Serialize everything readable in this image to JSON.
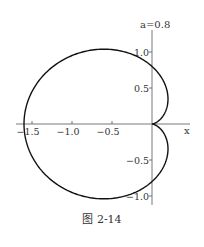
{
  "chart_data": {
    "type": "line",
    "title": "a=0.8",
    "curve": "cardioid r = a(1 - cos θ)",
    "parameter": {
      "name": "a",
      "value": 0.8
    },
    "xlabel": "x",
    "ylabel": "",
    "xlim": [
      -1.7,
      0.35
    ],
    "ylim": [
      -1.15,
      1.35
    ],
    "x_ticks": [
      -1.5,
      -1.0,
      -0.5
    ],
    "x_tick_labels": [
      "-1.5",
      "-1.0",
      "-0.5"
    ],
    "y_ticks": [
      1.0,
      0.5,
      -0.5,
      -1.0
    ],
    "y_tick_labels": [
      "1.0",
      "0.5",
      "-0.5",
      "-1.0"
    ],
    "key_points": [
      {
        "label": "cusp",
        "x": 0,
        "y": 0
      },
      {
        "label": "leftmost",
        "x": -1.6,
        "y": 0
      },
      {
        "label": "top",
        "x": -0.6,
        "y": 1.04
      },
      {
        "label": "bottom",
        "x": -0.6,
        "y": -1.04
      },
      {
        "label": "y-axis crossing upper",
        "x": 0,
        "y": 0.8
      },
      {
        "label": "y-axis crossing lower",
        "x": 0,
        "y": -0.8
      }
    ],
    "grid": false,
    "legend": null
  },
  "labels": {
    "annotation": "a=0.8",
    "x_axis": "x",
    "caption": "图 2-14"
  }
}
